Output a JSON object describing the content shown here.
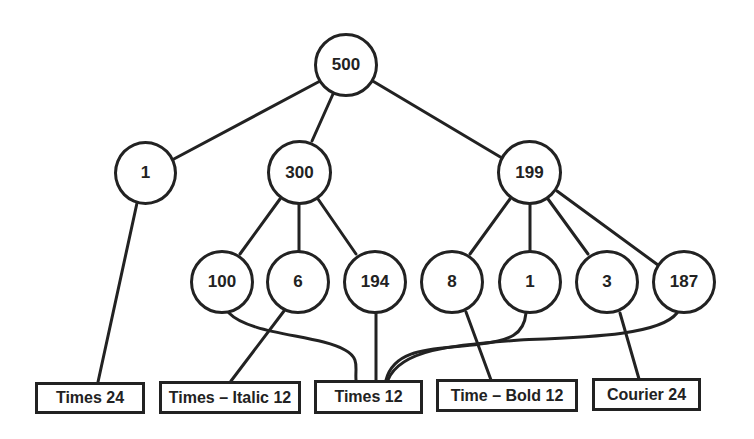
{
  "diagram": {
    "type": "tree",
    "root": {
      "id": "n500",
      "label": "500"
    },
    "level1": [
      {
        "id": "n1a",
        "label": "1"
      },
      {
        "id": "n300",
        "label": "300"
      },
      {
        "id": "n199",
        "label": "199"
      }
    ],
    "level2": [
      {
        "id": "n100",
        "label": "100",
        "parent": "300"
      },
      {
        "id": "n6",
        "label": "6",
        "parent": "300"
      },
      {
        "id": "n194",
        "label": "194",
        "parent": "300"
      },
      {
        "id": "n8",
        "label": "8",
        "parent": "199"
      },
      {
        "id": "n1b",
        "label": "1",
        "parent": "199"
      },
      {
        "id": "n3",
        "label": "3",
        "parent": "199"
      },
      {
        "id": "n187",
        "label": "187",
        "parent": "199"
      }
    ],
    "leaves": [
      {
        "id": "f1",
        "label": "Times 24",
        "from": [
          "1"
        ]
      },
      {
        "id": "f2",
        "label": "Times – Italic 12",
        "from": [
          "6"
        ]
      },
      {
        "id": "f3",
        "label": "Times 12",
        "from": [
          "100",
          "194",
          "1",
          "187"
        ]
      },
      {
        "id": "f4",
        "label": "Time – Bold 12",
        "from": [
          "8"
        ]
      },
      {
        "id": "f5",
        "label": "Courier 24",
        "from": [
          "3"
        ]
      }
    ],
    "colors": {
      "stroke": "#222222",
      "background": "#ffffff"
    }
  }
}
